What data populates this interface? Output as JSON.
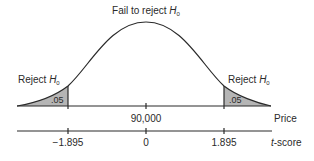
{
  "diagram": {
    "type": "two-tailed hypothesis test normal curve",
    "colors": {
      "line": "#2a2a2a",
      "shade": "#b5b5b5",
      "background": "#ffffff"
    },
    "labels": {
      "center": {
        "text": "Fail to reject ",
        "var": "H",
        "sub": "0"
      },
      "left": {
        "text": "Reject ",
        "var": "H",
        "sub": "0"
      },
      "right": {
        "text": "Reject ",
        "var": "H",
        "sub": "0"
      },
      "left_area": ".05",
      "right_area": ".05"
    },
    "price_axis": {
      "label": "Price",
      "ticks": [
        {
          "pos": "center",
          "value": "90,000"
        }
      ]
    },
    "t_axis": {
      "label_prefix": "t",
      "label_suffix": "-score",
      "ticks": [
        {
          "pos": "left",
          "value": "−1.895"
        },
        {
          "pos": "center",
          "value": "0"
        },
        {
          "pos": "right",
          "value": "1.895"
        }
      ]
    }
  }
}
